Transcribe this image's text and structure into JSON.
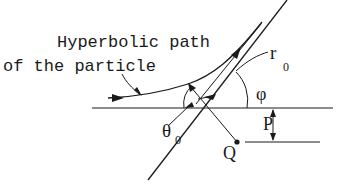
{
  "diagram": {
    "caption_lines": [
      "Hyperbolic path",
      "of the particle"
    ],
    "labels": {
      "radius": "r",
      "radius_subscript": "0",
      "angle_phi": "φ",
      "angle_theta": "θ",
      "angle_theta_subscript": "0",
      "impact_parameter": "P",
      "scattering_center": "Q"
    },
    "colors": {
      "ink": "#1a1a1a",
      "background": "#ffffff"
    }
  }
}
